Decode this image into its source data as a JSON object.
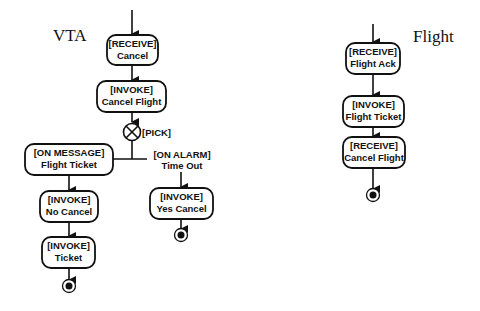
{
  "diagrams": {
    "vta": {
      "title": "VTA",
      "nodes": [
        {
          "id": "receive_cancel",
          "kind": "[RECEIVE]",
          "name": "Cancel"
        },
        {
          "id": "invoke_cancel_flight",
          "kind": "[INVOKE]",
          "name": "Cancel Flight"
        },
        {
          "id": "pick",
          "label": "[PICK]"
        },
        {
          "id": "on_message",
          "kind": "[ON MESSAGE]",
          "name": "Flight Ticket"
        },
        {
          "id": "on_alarm",
          "kind": "[ON ALARM]",
          "name": "Time Out"
        },
        {
          "id": "invoke_no_cancel",
          "kind": "[INVOKE]",
          "name": "No Cancel"
        },
        {
          "id": "invoke_ticket",
          "kind": "[INVOKE]",
          "name": "Ticket"
        },
        {
          "id": "invoke_yes_cancel",
          "kind": "[INVOKE]",
          "name": "Yes Cancel"
        }
      ]
    },
    "flight": {
      "title": "Flight",
      "nodes": [
        {
          "id": "receive_flight_ack",
          "kind": "[RECEIVE]",
          "name": "Flight Ack"
        },
        {
          "id": "invoke_flight_ticket",
          "kind": "[INVOKE]",
          "name": "Flight Ticket"
        },
        {
          "id": "receive_cancel_flight",
          "kind": "[RECEIVE]",
          "name": "Cancel Flight"
        }
      ]
    }
  }
}
